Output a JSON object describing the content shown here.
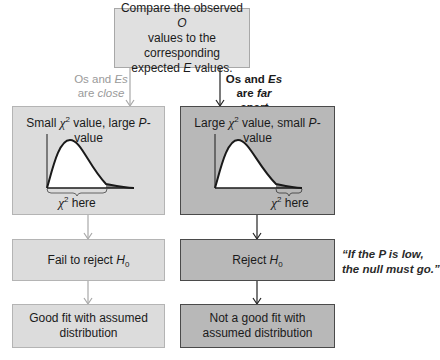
{
  "top_box": {
    "line1_pre": "Compare the observed ",
    "line1_var": "O",
    "line2": "values to the corresponding",
    "line3_pre": "expected ",
    "line3_var": "E",
    "line3_post": " values."
  },
  "branch_left_label": {
    "os": "Os",
    "and": " and ",
    "es": "Es",
    "line2_pre": "are ",
    "line2_em": "close"
  },
  "branch_right_label": {
    "os": "Os",
    "and": " and ",
    "es": "Es",
    "line2_pre": "are ",
    "line2_em": "far apart"
  },
  "left_chart_box": {
    "title_pre": "Small ",
    "chi": "χ",
    "sup": "2",
    "title_mid": " value, large ",
    "p": "P",
    "title_post": "-value",
    "annotation_chi": "χ",
    "annotation_sup": "2",
    "annotation_text": " here"
  },
  "right_chart_box": {
    "title_pre": "Large ",
    "chi": "χ",
    "sup": "2",
    "title_mid": " value, small ",
    "p": "P",
    "title_post": "-value",
    "annotation_chi": "χ",
    "annotation_sup": "2",
    "annotation_text": " here"
  },
  "fail_box": {
    "text": "Fail to reject ",
    "h": "H",
    "sub": "0"
  },
  "reject_box": {
    "text": "Reject ",
    "h": "H",
    "sub": "0"
  },
  "good_fit_box": {
    "line1": "Good fit with assumed",
    "line2": "distribution"
  },
  "not_good_fit_box": {
    "line1": "Not a good fit with",
    "line2": "assumed distribution"
  },
  "quote": {
    "line1": "“If the P is low,",
    "line2": "the null must go.”"
  },
  "colors": {
    "light_box": "#dcdcdc",
    "dark_box": "#b8b8b8",
    "light_arrow": "#a0a0a0",
    "dark_arrow": "#222222",
    "curve_fill": "#ffffff",
    "tail_fill": "#8a8a8a"
  }
}
